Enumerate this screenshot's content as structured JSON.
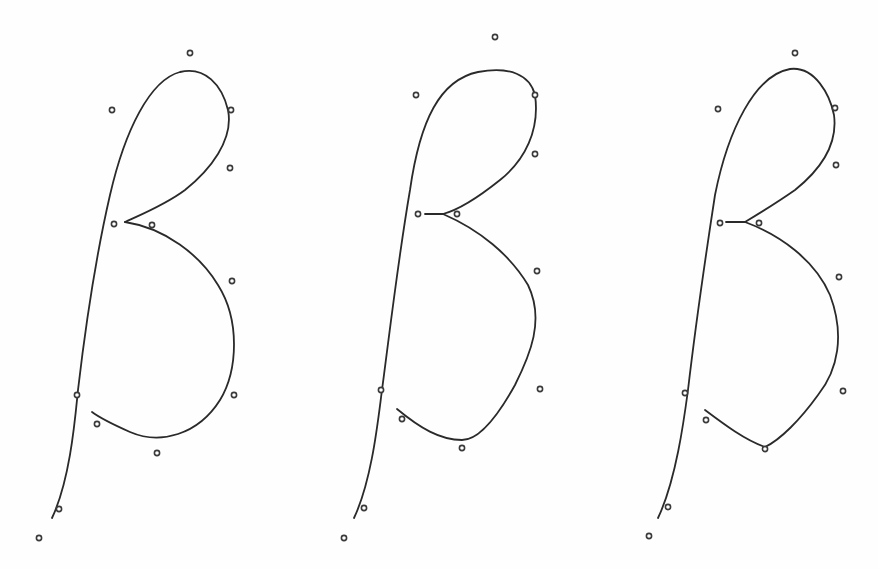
{
  "diagram": {
    "stroke_color": "#2a2a2a",
    "control_point_color": "#3a3a3a",
    "background": "#ffffff",
    "figures": [
      {
        "id": "beta-1",
        "variant": "smooth",
        "stem_path": "M52,518 C70,480 75,420 78,390 C85,330 95,260 110,195 C125,130 150,80 180,72 C205,66 222,85 228,110 C234,140 210,170 185,190 C165,205 140,215 125,222",
        "bowl_path": "M125,222 C165,228 200,255 218,285 C240,320 238,370 220,400 C198,435 160,445 130,432 C112,424 100,418 92,412",
        "control_points": [
          [
            190,
            53
          ],
          [
            112,
            110
          ],
          [
            231,
            110
          ],
          [
            230,
            168
          ],
          [
            114,
            224
          ],
          [
            152,
            225
          ],
          [
            232,
            281
          ],
          [
            234,
            395
          ],
          [
            77,
            395
          ],
          [
            97,
            424
          ],
          [
            157,
            453
          ],
          [
            59,
            509
          ],
          [
            39,
            538
          ]
        ]
      },
      {
        "id": "beta-2",
        "variant": "straight-segment",
        "stem_path": "M354,518 C372,480 378,420 382,390 C390,330 398,260 410,190 C420,120 440,80 478,72 C510,66 530,75 535,95 C540,130 525,160 500,180 C480,196 458,210 443,214 L425,214",
        "bowl_path": "M443,214 C480,230 510,255 528,285 C545,320 530,355 515,385 C500,412 480,440 462,440 C440,440 420,428 397,409",
        "control_points": [
          [
            495,
            37
          ],
          [
            416,
            95
          ],
          [
            535,
            95
          ],
          [
            535,
            154
          ],
          [
            418,
            214
          ],
          [
            457,
            214
          ],
          [
            537,
            271
          ],
          [
            540,
            389
          ],
          [
            381,
            390
          ],
          [
            402,
            419
          ],
          [
            462,
            448
          ],
          [
            364,
            508
          ],
          [
            344,
            538
          ]
        ]
      },
      {
        "id": "beta-3",
        "variant": "corner",
        "stem_path": "M658,518 C676,480 684,420 688,390 C695,330 705,260 715,195 C728,130 755,75 790,69 C815,66 830,95 834,115 C838,145 820,170 795,190 C775,204 755,216 745,222 L726,222",
        "bowl_path": "M745,222 C780,235 815,260 830,295 C845,335 838,370 818,395 C800,420 780,440 765,447 C745,440 725,425 705,410",
        "control_points": [
          [
            795,
            53
          ],
          [
            718,
            109
          ],
          [
            835,
            108
          ],
          [
            836,
            165
          ],
          [
            720,
            223
          ],
          [
            759,
            223
          ],
          [
            839,
            277
          ],
          [
            843,
            391
          ],
          [
            685,
            393
          ],
          [
            706,
            420
          ],
          [
            765,
            449
          ],
          [
            668,
            507
          ],
          [
            649,
            536
          ]
        ]
      }
    ]
  }
}
